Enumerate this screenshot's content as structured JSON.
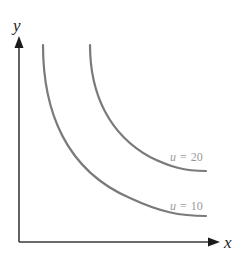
{
  "diagram": {
    "type": "indifference-curves",
    "axes": {
      "x_label": "x",
      "y_label": "y"
    },
    "curves": [
      {
        "id": "u10",
        "variable": "u",
        "equals": "=",
        "value": "10",
        "label": "u = 10",
        "color": "#7a7a7a"
      },
      {
        "id": "u20",
        "variable": "u",
        "equals": "=",
        "value": "20",
        "label": "u = 20",
        "color": "#7a7a7a"
      }
    ],
    "colors": {
      "axis": "#3a3a3a",
      "arrowhead": "#1a1a1a",
      "curve": "#7a7a7a",
      "curve_label": "#9a9a9a",
      "background": "#ffffff"
    }
  }
}
